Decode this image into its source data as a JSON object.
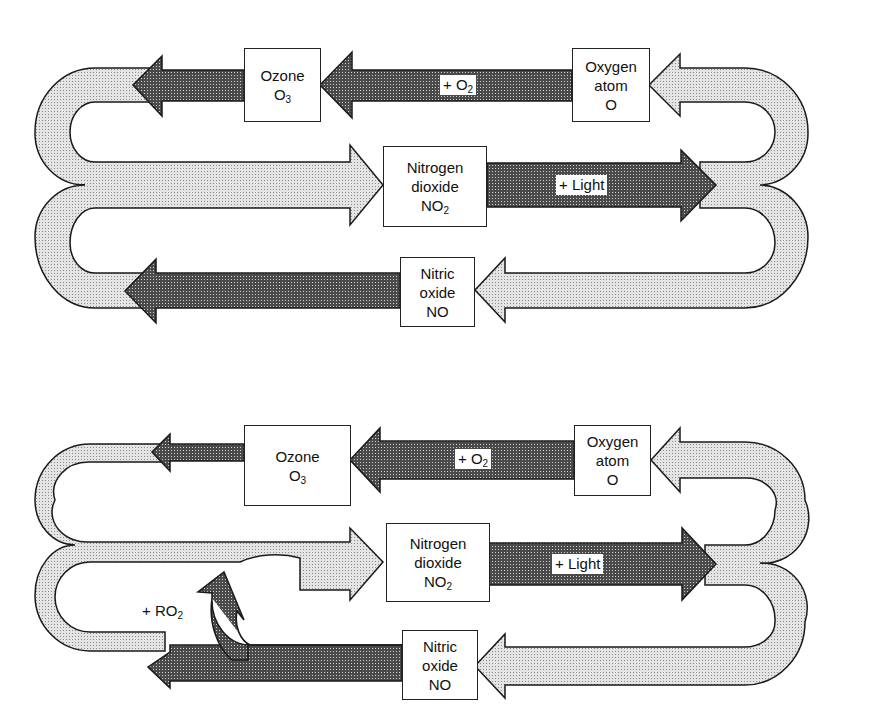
{
  "colors": {
    "light_arrow": "#d6d6d6",
    "dark_arrow": "#3a3a3a",
    "outline": "#1a1a1a",
    "box_bg": "#ffffff"
  },
  "diagrams": [
    {
      "id": "top",
      "title": "NO2 photolytic cycle (steady state)",
      "nodes": {
        "ozone": {
          "line1": "Ozone",
          "formula": "O",
          "sub": "3"
        },
        "oxygen_atom": {
          "line1": "Oxygen",
          "line2": "atom",
          "formula": "O"
        },
        "nitrogen_dioxide": {
          "line1": "Nitrogen",
          "line2": "dioxide",
          "formula": "NO",
          "sub": "2"
        },
        "nitric_oxide": {
          "line1": "Nitric",
          "line2": "oxide",
          "formula": "NO"
        }
      },
      "labels": {
        "plus_o2": {
          "text": "+ O",
          "sub": "2"
        },
        "plus_light": {
          "text": "+ Light"
        }
      }
    },
    {
      "id": "bottom",
      "title": "NO2 photolytic cycle with RO2 interference",
      "nodes": {
        "ozone": {
          "line1": "Ozone",
          "formula": "O",
          "sub": "3"
        },
        "oxygen_atom": {
          "line1": "Oxygen",
          "line2": "atom",
          "formula": "O"
        },
        "nitrogen_dioxide": {
          "line1": "Nitrogen",
          "line2": "dioxide",
          "formula": "NO",
          "sub": "2"
        },
        "nitric_oxide": {
          "line1": "Nitric",
          "line2": "oxide",
          "formula": "NO"
        }
      },
      "labels": {
        "plus_o2": {
          "text": "+ O",
          "sub": "2"
        },
        "plus_light": {
          "text": "+ Light"
        },
        "plus_ro2": {
          "text": "+ RO",
          "sub": "2"
        }
      }
    }
  ]
}
